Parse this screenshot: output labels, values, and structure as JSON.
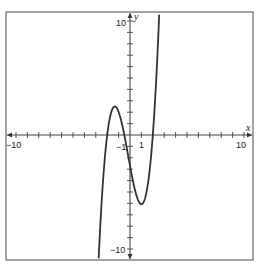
{
  "chart_data": {
    "type": "line",
    "title": "",
    "xlabel": "x",
    "ylabel": "y",
    "xlim": [
      -10,
      10
    ],
    "ylim": [
      -10,
      10
    ],
    "grid": false,
    "tick_step": 1,
    "x_tick_labels": [
      "-10",
      "-1",
      "1",
      "10"
    ],
    "y_tick_labels": [
      "10",
      "-10"
    ],
    "series": [
      {
        "name": "cubic polynomial",
        "function": "1.35*(x+2)*(x+0.5)*(x-2)",
        "zeros": [
          -2,
          -0.5,
          2
        ],
        "local_max": [
          -1.33,
          2.5
        ],
        "local_min": [
          1,
          -6.1
        ],
        "y_intercept": -2.7,
        "color": "#333333"
      }
    ]
  },
  "labels": {
    "x_axis": "x",
    "y_axis": "y",
    "x_min": "−10",
    "x_max": "10",
    "x_neg_one": "−1",
    "x_one": "1",
    "y_max": "10",
    "y_min": "−10"
  }
}
